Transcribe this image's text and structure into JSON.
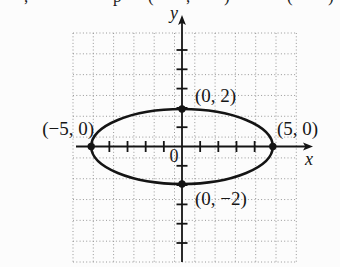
{
  "figure": {
    "cropped_top_line": {
      "fragments": [
        {
          "ch": ",",
          "x": 24
        },
        {
          "ch": "p",
          "x": 113
        },
        {
          "ch": "(",
          "x": 148
        },
        {
          "ch": ",",
          "x": 186
        },
        {
          "ch": ")",
          "x": 224
        },
        {
          "ch": "(",
          "x": 287
        },
        {
          "ch": ")",
          "x": 328
        }
      ]
    },
    "axis_labels": {
      "x": "x",
      "y": "y"
    },
    "origin_label": "0",
    "point_labels": {
      "top": "(0, 2)",
      "bottom": "(0, −2)",
      "left": "(−5, 0)",
      "right": "(5, 0)"
    }
  },
  "chart_data": {
    "type": "line",
    "curve": "ellipse",
    "center": [
      0,
      0
    ],
    "semi_axis_x": 5,
    "semi_axis_y": 2,
    "labeled_points": [
      {
        "x": -5,
        "y": 0,
        "label": "(−5, 0)"
      },
      {
        "x": 5,
        "y": 0,
        "label": "(5, 0)"
      },
      {
        "x": 0,
        "y": 2,
        "label": "(0, 2)"
      },
      {
        "x": 0,
        "y": -2,
        "label": "(0, −2)"
      }
    ],
    "xlabel": "x",
    "ylabel": "y",
    "origin_label": "0",
    "x_tick_step": 1,
    "y_tick_step": 1,
    "xlim": [
      -5.8,
      7.2
    ],
    "ylim": [
      -6.0,
      6.8
    ],
    "grid": "dotted",
    "legend": "none",
    "title": ""
  }
}
